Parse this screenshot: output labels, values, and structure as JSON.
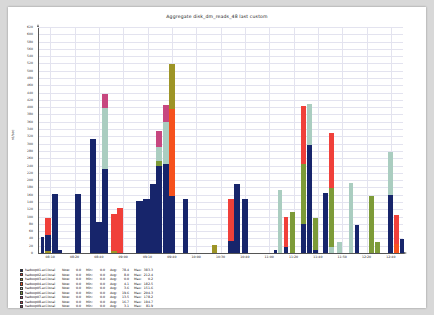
{
  "title": "Aggregate disk_dm_reads_48 last custom",
  "axes": {
    "ylabel": "rd/sec",
    "ymin": 0,
    "ymax": 620,
    "ytick_step": 20,
    "yticks": [
      0,
      20,
      40,
      60,
      80,
      100,
      120,
      140,
      160,
      180,
      200,
      220,
      240,
      260,
      280,
      300,
      320,
      340,
      360,
      380,
      400,
      420,
      440,
      460,
      480,
      500,
      520,
      540,
      560,
      580,
      600,
      620
    ],
    "xticks": [
      "08:10",
      "08:20",
      "08:40",
      "09:00",
      "09:10",
      "09:40",
      "10:00",
      "10:30",
      "10:40",
      "11:00",
      "11:20",
      "11:40",
      "11:50",
      "12:20",
      "12:40"
    ],
    "grid": true
  },
  "palette": {
    "navy": "#17256b",
    "red": "#f0403a",
    "olive": "#9d9426",
    "orange": "#f6511d",
    "sage": "#aacdc0",
    "olivegreen": "#7d9b38",
    "magenta": "#c7477f",
    "crimson": "#e0394d",
    "plum": "#8f3a5e"
  },
  "chart_data": {
    "type": "bar",
    "stacked": true,
    "title": "Aggregate disk_dm_reads_48 last custom",
    "xlabel": "",
    "ylabel": "rd/sec",
    "ylim": [
      0,
      620
    ],
    "legend_position": "below",
    "x": [
      "08:10",
      "08:20",
      "08:40",
      "09:00",
      "09:10",
      "09:40",
      "10:00",
      "10:30",
      "10:40",
      "11:00",
      "11:20",
      "11:40",
      "11:50",
      "12:20",
      "12:40"
    ],
    "series": [
      {
        "name": "hadoop01.eci.local",
        "color": "#17256b"
      },
      {
        "name": "hadoop02.eci.local",
        "color": "#f0403a"
      },
      {
        "name": "hadoop03.eci.local",
        "color": "#9d9426"
      },
      {
        "name": "hadoop04.eci.local",
        "color": "#f6511d"
      },
      {
        "name": "hadoop05.eci.local",
        "color": "#aacdc0"
      },
      {
        "name": "hadoop06.eci.local",
        "color": "#7d9b38"
      },
      {
        "name": "hadoop07.eci.local",
        "color": "#c7477f"
      },
      {
        "name": "hadoop08.eci.local",
        "color": "#e0394d"
      },
      {
        "name": "hadoop09.eci.local",
        "color": "#8f3a5e"
      }
    ],
    "bars": [
      {
        "x_px": 3,
        "w": 3.2,
        "segments": [
          {
            "c": "navy",
            "v": 48
          }
        ]
      },
      {
        "x_px": 7,
        "w": 6.0,
        "segments": [
          {
            "c": "olive",
            "v": 8
          },
          {
            "c": "navy",
            "v": 44
          },
          {
            "c": "red",
            "v": 46
          }
        ]
      },
      {
        "x_px": 14,
        "w": 5.5,
        "segments": [
          {
            "c": "navy",
            "v": 166
          }
        ]
      },
      {
        "x_px": 20,
        "w": 4.0,
        "segments": [
          {
            "c": "navy",
            "v": 10
          }
        ]
      },
      {
        "x_px": 37,
        "w": 6.0,
        "segments": [
          {
            "c": "navy",
            "v": 166
          }
        ]
      },
      {
        "x_px": 52,
        "w": 5.5,
        "segments": [
          {
            "c": "navy",
            "v": 316
          }
        ]
      },
      {
        "x_px": 58,
        "w": 5.5,
        "segments": [
          {
            "c": "navy",
            "v": 88
          }
        ]
      },
      {
        "x_px": 64,
        "w": 5.5,
        "segments": [
          {
            "c": "navy",
            "v": 232
          },
          {
            "c": "sage",
            "v": 168
          },
          {
            "c": "magenta",
            "v": 40
          }
        ]
      },
      {
        "x_px": 73,
        "w": 5.5,
        "segments": [
          {
            "c": "olive",
            "v": 8
          },
          {
            "c": "red",
            "v": 102
          }
        ]
      },
      {
        "x_px": 79,
        "w": 5.5,
        "segments": [
          {
            "c": "red",
            "v": 126
          }
        ]
      },
      {
        "x_px": 98,
        "w": 6.5,
        "segments": [
          {
            "c": "navy",
            "v": 146
          }
        ]
      },
      {
        "x_px": 105,
        "w": 6.5,
        "segments": [
          {
            "c": "navy",
            "v": 150
          }
        ]
      },
      {
        "x_px": 112,
        "w": 6.0,
        "segments": [
          {
            "c": "navy",
            "v": 192
          }
        ]
      },
      {
        "x_px": 118,
        "w": 6.0,
        "segments": [
          {
            "c": "navy",
            "v": 242
          },
          {
            "c": "olivegreen",
            "v": 14
          },
          {
            "c": "sage",
            "v": 38
          },
          {
            "c": "magenta",
            "v": 44
          }
        ]
      },
      {
        "x_px": 125,
        "w": 6.0,
        "segments": [
          {
            "c": "navy",
            "v": 246
          },
          {
            "c": "sage",
            "v": 116
          },
          {
            "c": "magenta",
            "v": 46
          }
        ]
      },
      {
        "x_px": 131,
        "w": 5.5,
        "segments": [
          {
            "c": "navy",
            "v": 160
          },
          {
            "c": "orange",
            "v": 238
          },
          {
            "c": "olive",
            "v": 124
          }
        ]
      },
      {
        "x_px": 145,
        "w": 5.0,
        "segments": [
          {
            "c": "navy",
            "v": 150
          }
        ]
      },
      {
        "x_px": 174,
        "w": 4.5,
        "segments": [
          {
            "c": "olive",
            "v": 24
          }
        ]
      },
      {
        "x_px": 190,
        "w": 5.5,
        "segments": [
          {
            "c": "navy",
            "v": 36
          },
          {
            "c": "red",
            "v": 116
          }
        ]
      },
      {
        "x_px": 196,
        "w": 6.0,
        "segments": [
          {
            "c": "navy",
            "v": 192
          }
        ]
      },
      {
        "x_px": 204,
        "w": 6.0,
        "segments": [
          {
            "c": "navy",
            "v": 150
          }
        ]
      },
      {
        "x_px": 236,
        "w": 3.0,
        "segments": [
          {
            "c": "navy",
            "v": 10
          }
        ]
      },
      {
        "x_px": 240,
        "w": 4.0,
        "segments": [
          {
            "c": "sage",
            "v": 176
          }
        ]
      },
      {
        "x_px": 246,
        "w": 4.0,
        "segments": [
          {
            "c": "navy",
            "v": 18
          },
          {
            "c": "red",
            "v": 84
          }
        ]
      },
      {
        "x_px": 252,
        "w": 4.5,
        "segments": [
          {
            "c": "olivegreen",
            "v": 116
          }
        ]
      },
      {
        "x_px": 263,
        "w": 4.5,
        "segments": [
          {
            "c": "navy",
            "v": 82
          },
          {
            "c": "olivegreen",
            "v": 164
          },
          {
            "c": "red",
            "v": 160
          }
        ]
      },
      {
        "x_px": 269,
        "w": 4.5,
        "segments": [
          {
            "c": "navy",
            "v": 300
          },
          {
            "c": "sage",
            "v": 112
          }
        ]
      },
      {
        "x_px": 275,
        "w": 4.5,
        "segments": [
          {
            "c": "navy",
            "v": 10
          },
          {
            "c": "olivegreen",
            "v": 88
          }
        ]
      },
      {
        "x_px": 285,
        "w": 5.0,
        "segments": [
          {
            "c": "navy",
            "v": 168
          }
        ]
      },
      {
        "x_px": 291,
        "w": 5.0,
        "segments": [
          {
            "c": "sage",
            "v": 18
          },
          {
            "c": "olivegreen",
            "v": 162
          },
          {
            "c": "red",
            "v": 152
          }
        ]
      },
      {
        "x_px": 299,
        "w": 4.5,
        "segments": [
          {
            "c": "sage",
            "v": 34
          }
        ]
      },
      {
        "x_px": 311,
        "w": 4.0,
        "segments": [
          {
            "c": "sage",
            "v": 194
          }
        ]
      },
      {
        "x_px": 317,
        "w": 4.0,
        "segments": [
          {
            "c": "navy",
            "v": 80
          }
        ]
      },
      {
        "x_px": 331,
        "w": 4.5,
        "segments": [
          {
            "c": "olivegreen",
            "v": 158
          }
        ]
      },
      {
        "x_px": 337,
        "w": 4.5,
        "segments": [
          {
            "c": "olivegreen",
            "v": 32
          }
        ]
      },
      {
        "x_px": 350,
        "w": 4.5,
        "segments": [
          {
            "c": "navy",
            "v": 162
          },
          {
            "c": "sage",
            "v": 118
          }
        ]
      },
      {
        "x_px": 356,
        "w": 4.5,
        "segments": [
          {
            "c": "orange",
            "v": 28
          },
          {
            "c": "red",
            "v": 80
          }
        ]
      },
      {
        "x_px": 362,
        "w": 4.0,
        "segments": [
          {
            "c": "navy",
            "v": 42
          }
        ]
      }
    ]
  },
  "legend": {
    "columns": [
      "Now",
      "Min",
      "Avg",
      "Max"
    ],
    "rows": [
      {
        "color": "#17256b",
        "name": "hadoop01.eci.local",
        "now": "0.0",
        "min": "0.0",
        "avg": "78.4",
        "max": "383.3",
        "now_label": "Now:",
        "min_label": "Min:",
        "avg_label": "Avg:",
        "max_label": "Max:"
      },
      {
        "color": "#f0403a",
        "name": "hadoop02.eci.local",
        "now": "0.0",
        "min": "0.0",
        "avg": "8.0",
        "max": "212.4",
        "now_label": "Now:",
        "min_label": "Min:",
        "avg_label": "Avg:",
        "max_label": "Max:"
      },
      {
        "color": "#9d9426",
        "name": "hadoop03.eci.local",
        "now": "0.0",
        "min": "0.0",
        "avg": "0.0",
        "max": "0.2",
        "now_label": "Now:",
        "min_label": "Min:",
        "avg_label": "Avg:",
        "max_label": "Max:"
      },
      {
        "color": "#f6511d",
        "name": "hadoop04.eci.local",
        "now": "0.0",
        "min": "0.0",
        "avg": "4.1",
        "max": "182.5",
        "now_label": "Now:",
        "min_label": "Min:",
        "avg_label": "Avg:",
        "max_label": "Max:"
      },
      {
        "color": "#aacdc0",
        "name": "hadoop05.eci.local",
        "now": "0.0",
        "min": "0.0",
        "avg": "3.6",
        "max": "151.6",
        "now_label": "Now:",
        "min_label": "Min:",
        "avg_label": "Avg:",
        "max_label": "Max:"
      },
      {
        "color": "#7d9b38",
        "name": "hadoop06.eci.local",
        "now": "0.0",
        "min": "0.0",
        "avg": "19.6",
        "max": "204.3",
        "now_label": "Now:",
        "min_label": "Min:",
        "avg_label": "Avg:",
        "max_label": "Max:"
      },
      {
        "color": "#c7477f",
        "name": "hadoop07.eci.local",
        "now": "0.0",
        "min": "0.0",
        "avg": "13.5",
        "max": "178.2",
        "now_label": "Now:",
        "min_label": "Min:",
        "avg_label": "Avg:",
        "max_label": "Max:"
      },
      {
        "color": "#e0394d",
        "name": "hadoop08.eci.local",
        "now": "0.0",
        "min": "0.0",
        "avg": "16.7",
        "max": "194.7",
        "now_label": "Now:",
        "min_label": "Min:",
        "avg_label": "Avg:",
        "max_label": "Max:"
      },
      {
        "color": "#8f3a5e",
        "name": "hadoop09.eci.local",
        "now": "0.0",
        "min": "0.0",
        "avg": "3.1",
        "max": "81.9",
        "now_label": "Now:",
        "min_label": "Min:",
        "avg_label": "Avg:",
        "max_label": "Max:"
      }
    ]
  }
}
